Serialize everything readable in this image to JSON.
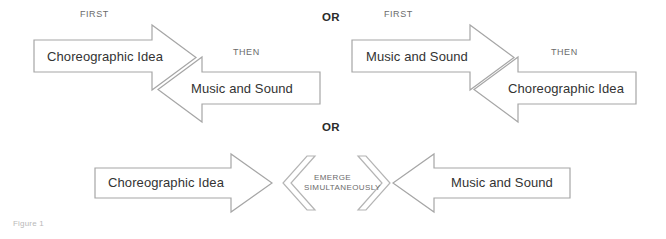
{
  "figure": {
    "caption": "Figure 1",
    "title_absent": true
  },
  "colors": {
    "arrow_stroke": "#a6a6a6",
    "chevron_stroke": "#b4b4b4",
    "node_text": "#333333",
    "sequence_text": "#6b6b6b",
    "or_text": "#2b2b2b",
    "caption_text": "#b9b9b9",
    "background": "#ffffff"
  },
  "connectors": {
    "or_top": "OR",
    "or_middle": "OR"
  },
  "options": [
    {
      "id": "option-1",
      "position": "top-left",
      "steps": [
        {
          "order_label": "FIRST",
          "node": "Choreographic Idea",
          "direction": "right"
        },
        {
          "order_label": "THEN",
          "node": "Music and Sound",
          "direction": "left"
        }
      ]
    },
    {
      "id": "option-2",
      "position": "top-right",
      "steps": [
        {
          "order_label": "FIRST",
          "node": "Music and Sound",
          "direction": "right"
        },
        {
          "order_label": "THEN",
          "node": "Choreographic Idea",
          "direction": "left"
        }
      ]
    },
    {
      "id": "option-3",
      "position": "bottom",
      "relation": "EMERGE\nSIMULTANEOUSLY",
      "relation_line1": "EMERGE",
      "relation_line2": "SIMULTANEOUSLY",
      "steps": [
        {
          "order_label": "",
          "node": "Choreographic Idea",
          "direction": "right"
        },
        {
          "order_label": "",
          "node": "Music and Sound",
          "direction": "left"
        }
      ]
    }
  ]
}
